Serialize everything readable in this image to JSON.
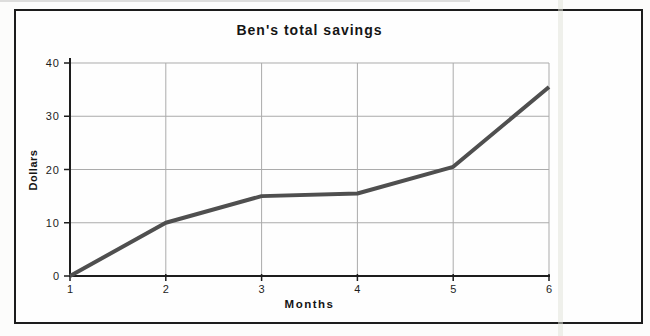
{
  "page": {
    "background": "#fcfcfb",
    "frame_border_color": "#1c1c1c",
    "scan_artifact_color": "#e0e1d7",
    "scan_edge_color": "#c2c2c2"
  },
  "chart_data": {
    "type": "line",
    "title": "Ben's total savings",
    "xlabel": "Months",
    "ylabel": "Dollars",
    "x": [
      1,
      2,
      3,
      4,
      5,
      6
    ],
    "values": [
      0,
      10,
      15,
      15.5,
      20.5,
      35.5
    ],
    "xlim": [
      1,
      6
    ],
    "ylim": [
      0,
      40
    ],
    "xticks": [
      1,
      2,
      3,
      4,
      5,
      6
    ],
    "xtick_labels": [
      "1",
      "2",
      "3",
      "4",
      "5",
      "6"
    ],
    "yticks": [
      0,
      10,
      20,
      30,
      40
    ],
    "ytick_labels": [
      "0",
      "10",
      "20",
      "30",
      "40"
    ],
    "grid": true,
    "legend": false,
    "colors": {
      "line": "#4f4f4f",
      "grid": "#ababab",
      "axis": "#1d1d1d",
      "text": "#1d1d1d"
    }
  }
}
